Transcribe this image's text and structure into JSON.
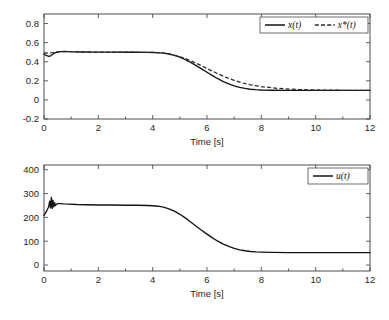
{
  "figure": {
    "background": "#ffffff",
    "line_color": "#141414",
    "axis_color": "#3a3a3a"
  },
  "chart_data": [
    {
      "id": "state-plot",
      "type": "line",
      "title": "",
      "xlabel": "Time [s]",
      "ylabel": "",
      "xlim": [
        0,
        12
      ],
      "ylim": [
        -0.2,
        0.9
      ],
      "xticks": [
        0,
        2,
        4,
        6,
        8,
        10,
        12
      ],
      "xticklabels": [
        "0",
        "2",
        "4",
        "6",
        "8",
        "10",
        "12"
      ],
      "yticks": [
        -0.2,
        0,
        0.2,
        0.4,
        0.6,
        0.8
      ],
      "yticklabels": [
        "-0.2",
        "0",
        "0.2",
        "0.4",
        "0.6",
        "0.8"
      ],
      "grid": false,
      "legend_position": "upper right",
      "legend": [
        {
          "label": "x(t)",
          "style": "solid"
        },
        {
          "label": "x*(t)",
          "style": "dashed"
        }
      ],
      "series": [
        {
          "name": "x(t)",
          "style": "solid",
          "x": [
            0.0,
            0.1,
            0.18,
            0.25,
            0.32,
            0.4,
            0.5,
            0.62,
            0.75,
            0.9,
            1.1,
            1.4,
            1.8,
            2.2,
            2.6,
            3.0,
            3.4,
            3.8,
            4.0,
            4.2,
            4.4,
            4.6,
            4.8,
            5.0,
            5.2,
            5.4,
            5.6,
            5.8,
            6.0,
            6.2,
            6.4,
            6.6,
            6.8,
            7.0,
            7.2,
            7.4,
            7.6,
            7.8,
            8.0,
            8.4,
            9.0,
            9.6,
            10.2,
            11.0,
            11.6,
            12.0
          ],
          "y": [
            0.48,
            0.463,
            0.455,
            0.462,
            0.478,
            0.492,
            0.502,
            0.506,
            0.507,
            0.506,
            0.504,
            0.502,
            0.501,
            0.5,
            0.5,
            0.499,
            0.499,
            0.498,
            0.497,
            0.495,
            0.49,
            0.481,
            0.467,
            0.448,
            0.423,
            0.394,
            0.36,
            0.325,
            0.29,
            0.255,
            0.222,
            0.192,
            0.168,
            0.148,
            0.132,
            0.12,
            0.112,
            0.107,
            0.104,
            0.101,
            0.1,
            0.1,
            0.1,
            0.1,
            0.1,
            0.1
          ]
        },
        {
          "name": "x*(t)",
          "style": "dashed",
          "x": [
            0.0,
            0.15,
            0.3,
            0.5,
            0.75,
            1.0,
            1.5,
            2.0,
            2.5,
            3.0,
            3.5,
            4.0,
            4.3,
            4.6,
            4.9,
            5.2,
            5.5,
            5.8,
            6.1,
            6.4,
            6.7,
            7.0,
            7.3,
            7.6,
            8.0,
            8.6,
            9.4,
            10.2,
            11.0,
            12.0
          ],
          "y": [
            0.492,
            0.49,
            0.494,
            0.503,
            0.507,
            0.506,
            0.503,
            0.501,
            0.5,
            0.5,
            0.499,
            0.498,
            0.493,
            0.482,
            0.461,
            0.434,
            0.398,
            0.358,
            0.315,
            0.274,
            0.236,
            0.204,
            0.178,
            0.158,
            0.139,
            0.121,
            0.108,
            0.103,
            0.101,
            0.1
          ]
        }
      ]
    },
    {
      "id": "control-plot",
      "type": "line",
      "title": "",
      "xlabel": "Time [s]",
      "ylabel": "",
      "xlim": [
        0,
        12
      ],
      "ylim": [
        -25,
        420
      ],
      "xticks": [
        0,
        2,
        4,
        6,
        8,
        10,
        12
      ],
      "xticklabels": [
        "0",
        "2",
        "4",
        "6",
        "8",
        "10",
        "12"
      ],
      "yticks": [
        0,
        100,
        200,
        300,
        400
      ],
      "yticklabels": [
        "0",
        "100",
        "200",
        "300",
        "400"
      ],
      "grid": false,
      "legend_position": "upper right",
      "legend": [
        {
          "label": "u(t)",
          "style": "solid"
        }
      ],
      "series": [
        {
          "name": "u(t)",
          "style": "solid",
          "x": [
            0.0,
            0.06,
            0.12,
            0.17,
            0.21,
            0.24,
            0.27,
            0.3,
            0.33,
            0.36,
            0.39,
            0.42,
            0.46,
            0.52,
            0.6,
            0.72,
            0.9,
            1.2,
            1.6,
            2.0,
            2.5,
            3.0,
            3.4,
            3.8,
            4.0,
            4.2,
            4.4,
            4.6,
            4.8,
            5.0,
            5.2,
            5.4,
            5.6,
            5.8,
            6.0,
            6.2,
            6.4,
            6.6,
            6.8,
            7.0,
            7.2,
            7.4,
            7.6,
            7.8,
            8.0,
            8.4,
            9.0,
            9.8,
            10.6,
            11.4,
            12.0
          ],
          "y": [
            208,
            220,
            232,
            244,
            268,
            240,
            284,
            238,
            272,
            244,
            262,
            250,
            256,
            258,
            258,
            257,
            256,
            254,
            253,
            252,
            252,
            251,
            251,
            250,
            249,
            247,
            243,
            236,
            226,
            213,
            198,
            181,
            163,
            146,
            130,
            114,
            100,
            88,
            78,
            70,
            64,
            60,
            57,
            55,
            54,
            53,
            52,
            52,
            52,
            52,
            52
          ]
        }
      ]
    }
  ]
}
